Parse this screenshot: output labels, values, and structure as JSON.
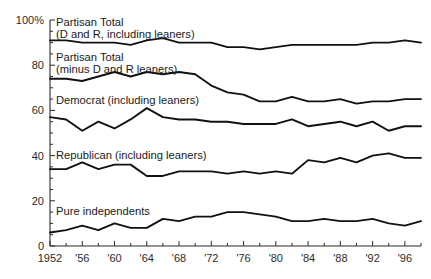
{
  "chart_data": {
    "type": "line",
    "title": "",
    "subtitle": "",
    "xlabel": "",
    "ylabel": "",
    "xlim": [
      1952,
      1998
    ],
    "ylim": [
      0,
      100
    ],
    "grid": false,
    "legend_position": "inline-labels",
    "x": [
      1952,
      1954,
      1956,
      1958,
      1960,
      1962,
      1964,
      1966,
      1968,
      1970,
      1972,
      1974,
      1976,
      1978,
      1980,
      1982,
      1984,
      1986,
      1988,
      1990,
      1992,
      1994,
      1996,
      1998
    ],
    "x_tick_labels": [
      "1952",
      "'56",
      "'60",
      "'64",
      "'68",
      "'72",
      "'76",
      "'80",
      "'84",
      "'88",
      "'92",
      "'96"
    ],
    "x_tick_values": [
      1952,
      1956,
      1960,
      1964,
      1968,
      1972,
      1976,
      1980,
      1984,
      1988,
      1992,
      1996
    ],
    "x_minor_tick_step": 2,
    "y_tick_labels": [
      "0",
      "20",
      "40",
      "60",
      "80",
      "100%"
    ],
    "y_tick_values": [
      0,
      20,
      40,
      60,
      80,
      100
    ],
    "y_minor_tick_step": 5,
    "series": [
      {
        "name": "Partisan Total (D and R, including leaners)",
        "label_line_1": "Partisan Total",
        "label_line_2": "(D and R, including leaners)",
        "values": [
          91,
          91,
          90,
          90,
          90,
          89,
          91,
          92,
          90,
          90,
          90,
          88,
          88,
          87,
          88,
          89,
          89,
          89,
          89,
          89,
          90,
          90,
          91,
          90
        ]
      },
      {
        "name": "Partisan Total (minus D and R leaners)",
        "label_line_1": "Partisan Total",
        "label_line_2": "(minus D and R leaners)",
        "values": [
          74,
          74,
          73,
          75,
          77,
          75,
          77,
          76,
          77,
          76,
          71,
          68,
          67,
          64,
          64,
          66,
          64,
          64,
          65,
          63,
          64,
          64,
          65,
          65
        ]
      },
      {
        "name": "Democrat (including leaners)",
        "label_line_1": "Democrat (including leaners)",
        "label_line_2": "",
        "values": [
          57,
          56,
          51,
          55,
          52,
          56,
          61,
          57,
          56,
          56,
          55,
          55,
          54,
          54,
          54,
          56,
          53,
          54,
          55,
          53,
          55,
          51,
          53,
          53
        ]
      },
      {
        "name": "Republican (including leaners)",
        "label_line_1": "Republican (including leaners)",
        "label_line_2": "",
        "values": [
          34,
          34,
          37,
          34,
          36,
          36,
          31,
          31,
          33,
          33,
          33,
          32,
          33,
          32,
          33,
          32,
          38,
          37,
          39,
          37,
          40,
          41,
          39,
          39
        ]
      },
      {
        "name": "Pure independents",
        "label_line_1": "Pure independents",
        "label_line_2": "",
        "values": [
          6,
          7,
          9,
          7,
          10,
          8,
          8,
          12,
          11,
          13,
          13,
          15,
          15,
          14,
          13,
          11,
          11,
          12,
          11,
          11,
          12,
          10,
          9,
          11
        ]
      }
    ]
  },
  "axes": {
    "y_top_label": "100%",
    "y_labels": [
      "100%",
      "80",
      "60",
      "40",
      "20",
      "0"
    ],
    "x_labels": [
      "1952",
      "'56",
      "'60",
      "'64",
      "'68",
      "'72",
      "'76",
      "'80",
      "'84",
      "'88",
      "'92",
      "'96"
    ]
  },
  "colors": {
    "line": "#111111",
    "axis": "#2b2b2b",
    "background": "#ffffff"
  }
}
